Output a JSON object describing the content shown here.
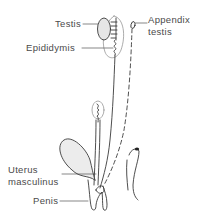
{
  "diagram": {
    "labels": {
      "testis": "Testis",
      "epididymis": "Epididymis",
      "appendix_testis_line1": "Appendix",
      "appendix_testis_line2": "testis",
      "uterus_masculinus_line1": "Uterus",
      "uterus_masculinus_line2": "masculinus",
      "penis": "Penis"
    },
    "colors": {
      "line": "#3a3a3a",
      "shade": "#ececec",
      "text": "#4a4a4a"
    }
  }
}
